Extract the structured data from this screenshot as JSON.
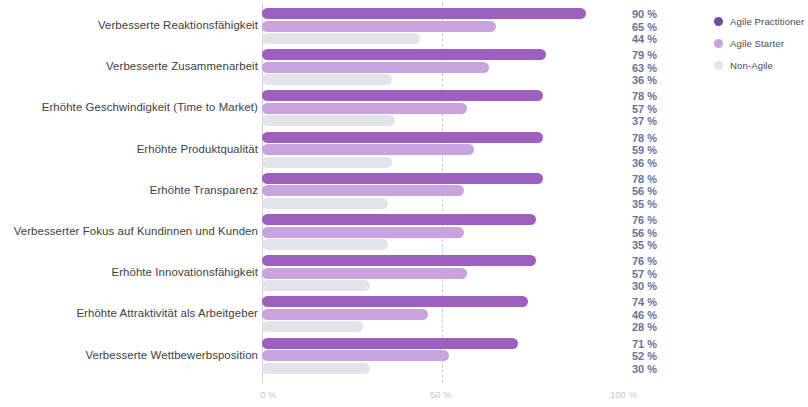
{
  "chart_data": {
    "type": "bar",
    "orientation": "horizontal",
    "title": "",
    "subtitle": "",
    "xlabel": "",
    "ylabel": "",
    "xlim": [
      0,
      100
    ],
    "grid": true,
    "gridlines": [
      50
    ],
    "legend_position": "right",
    "xticks": [
      {
        "value": 0,
        "label": "0 %"
      },
      {
        "value": 50,
        "label": "50 %"
      },
      {
        "value": 100,
        "label": "100 %"
      }
    ],
    "categories": [
      "Verbesserte Reaktionsfähigkeit",
      "Verbesserte Zusammenarbeit",
      "Erhöhte Geschwindigkeit (Time to Market)",
      "Erhöhte Produktqualität",
      "Erhöhte Transparenz",
      "Verbesserter Fokus auf Kundinnen und Kunden",
      "Erhöhte Innovationsfähigkeit",
      "Erhöhte Attraktivität als Arbeitgeber",
      "Verbesserte Wettbewerbsposition"
    ],
    "series": [
      {
        "name": "Agile Practitioner",
        "color": "#9f5fbf",
        "legend_color": "#6b4f9e",
        "values": [
          90,
          79,
          78,
          78,
          78,
          76,
          76,
          74,
          71
        ],
        "labels": [
          "90 %",
          "79 %",
          "78 %",
          "78 %",
          "78 %",
          "76 %",
          "76 %",
          "74 %",
          "71 %"
        ]
      },
      {
        "name": "Agile Starter",
        "color": "#c9a3de",
        "legend_color": "#c9a3de",
        "values": [
          65,
          63,
          57,
          59,
          56,
          56,
          57,
          46,
          52
        ],
        "labels": [
          "65 %",
          "63 %",
          "57 %",
          "59 %",
          "56 %",
          "56 %",
          "57 %",
          "46 %",
          "52 %"
        ]
      },
      {
        "name": "Non-Agile",
        "color": "#e3e3ec",
        "legend_color": "#e3e3ec",
        "values": [
          44,
          36,
          37,
          36,
          35,
          35,
          30,
          28,
          30
        ],
        "labels": [
          "44 %",
          "36 %",
          "37 %",
          "36 %",
          "35 %",
          "35 %",
          "30 %",
          "28 %",
          "30 %"
        ]
      }
    ]
  },
  "legend": {
    "items": [
      {
        "label": "Agile Practitioner"
      },
      {
        "label": "Agile Starter"
      },
      {
        "label": "Non-Agile"
      }
    ]
  }
}
